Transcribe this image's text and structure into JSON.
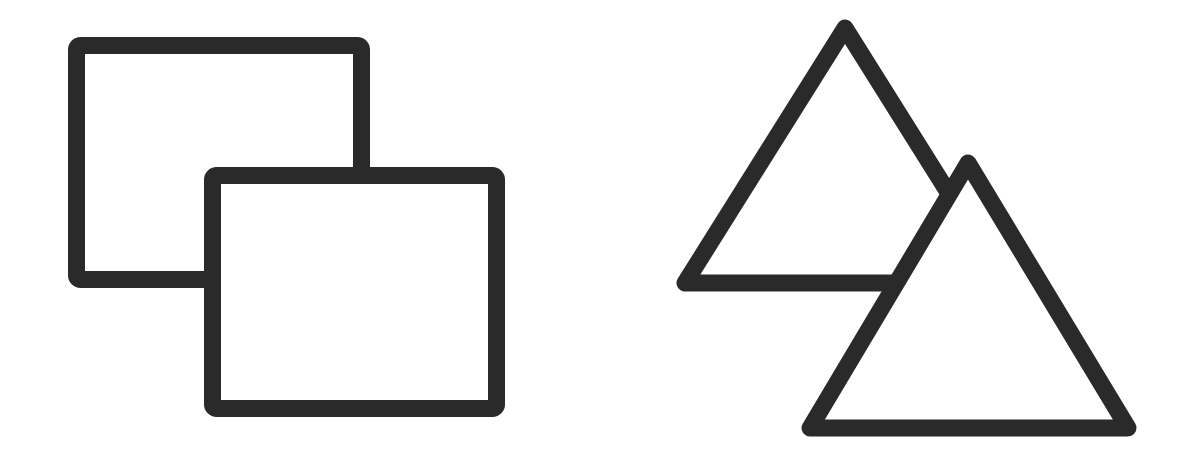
{
  "diagram": {
    "background": "#ffffff",
    "stroke_color": "#2a2a2a",
    "stroke_width": 17,
    "groups": [
      {
        "name": "overlapping-rectangles",
        "shapes": [
          {
            "type": "rect",
            "role": "back",
            "x": 76.5,
            "y": 45.5,
            "w": 285,
            "h": 234,
            "fill": "#ffffff"
          },
          {
            "type": "rect",
            "role": "front",
            "x": 212.5,
            "y": 175.5,
            "w": 284,
            "h": 233,
            "fill": "#ffffff"
          }
        ]
      },
      {
        "name": "overlapping-triangles",
        "shapes": [
          {
            "type": "triangle",
            "role": "back",
            "points": "845,28 685,283 1005,283",
            "fill": "#ffffff"
          },
          {
            "type": "triangle",
            "role": "front",
            "points": "968,163 810,428 1128,428",
            "fill": "#ffffff"
          }
        ]
      }
    ]
  }
}
